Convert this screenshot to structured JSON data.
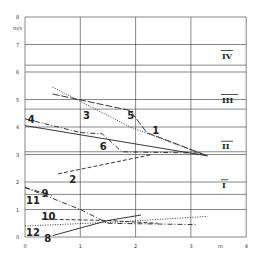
{
  "chart_data": {
    "type": "line",
    "title": "",
    "xlabel": "m",
    "ylabel": "m/s",
    "xlim": [
      0,
      4
    ],
    "ylim": [
      0,
      8
    ],
    "x_ticks": [
      "0",
      "1",
      "2",
      "3",
      "4"
    ],
    "y_ticks": [
      "0",
      "1",
      "2",
      "3",
      "4",
      "5",
      "6",
      "7",
      "8"
    ],
    "grid": true,
    "extra_horizontal_lines": [
      6.25,
      4.65,
      3.1,
      1.55
    ],
    "zones": [
      {
        "label": "IV",
        "y": 6.6
      },
      {
        "label": "III",
        "y": 5.0
      },
      {
        "label": "II",
        "y": 3.3
      },
      {
        "label": "I",
        "y": 1.9
      }
    ],
    "series": [
      {
        "name": "1",
        "style": "solid",
        "points": [
          [
            0,
            4.05
          ],
          [
            3.3,
            2.95
          ]
        ],
        "label_pos": [
          2.3,
          3.9
        ]
      },
      {
        "name": "2",
        "style": "dashed",
        "points": [
          [
            0.6,
            2.3
          ],
          [
            2.3,
            3.0
          ]
        ],
        "label_pos": [
          0.8,
          2.1
        ]
      },
      {
        "name": "3",
        "style": "dotted",
        "points": [
          [
            0.5,
            5.45
          ],
          [
            1.9,
            4.0
          ],
          [
            3.3,
            2.95
          ]
        ],
        "label_pos": [
          1.05,
          4.45
        ]
      },
      {
        "name": "4",
        "style": "dashdot",
        "points": [
          [
            0,
            4.3
          ],
          [
            1.0,
            3.8
          ]
        ],
        "label_pos": [
          0.05,
          4.3
        ]
      },
      {
        "name": "5",
        "style": "longdash",
        "points": [
          [
            0.5,
            5.2
          ],
          [
            1.9,
            4.6
          ],
          [
            2.2,
            3.8
          ],
          [
            3.3,
            2.95
          ]
        ],
        "label_pos": [
          1.85,
          4.45
        ]
      },
      {
        "name": "6",
        "style": "dashdot",
        "points": [
          [
            1.0,
            3.8
          ],
          [
            1.4,
            3.75
          ],
          [
            1.75,
            3.1
          ],
          [
            3.2,
            3.05
          ]
        ],
        "label_pos": [
          1.35,
          3.3
        ]
      },
      {
        "name": "8",
        "style": "solid",
        "points": [
          [
            0.5,
            0.05
          ],
          [
            1.5,
            0.6
          ],
          [
            2.1,
            0.8
          ]
        ],
        "label_pos": [
          0.35,
          -0.05
        ]
      },
      {
        "name": "9",
        "style": "dashdot",
        "points": [
          [
            0,
            1.8
          ],
          [
            1.0,
            1.0
          ],
          [
            1.5,
            0.5
          ],
          [
            3.1,
            0.45
          ]
        ],
        "label_pos": [
          0.3,
          1.6
        ]
      },
      {
        "name": "10",
        "style": "dashed",
        "points": [
          [
            0.3,
            0.65
          ],
          [
            1.5,
            0.6
          ],
          [
            2.4,
            0.5
          ]
        ],
        "label_pos": [
          0.3,
          0.75
        ]
      },
      {
        "name": "11",
        "style": "dashdot",
        "points": [
          [
            0,
            1.8
          ],
          [
            0.5,
            1.5
          ]
        ],
        "label_pos": [
          0.02,
          1.35
        ]
      },
      {
        "name": "12",
        "style": "dotted",
        "points": [
          [
            0,
            0.4
          ],
          [
            1.7,
            0.55
          ],
          [
            3.3,
            0.75
          ]
        ],
        "label_pos": [
          0.02,
          0.2
        ]
      }
    ]
  }
}
